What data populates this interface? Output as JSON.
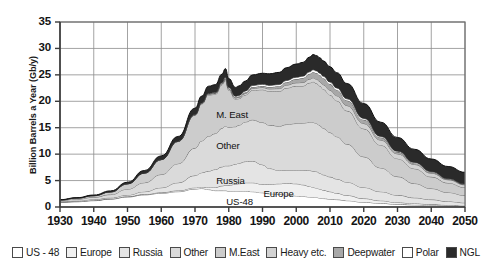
{
  "chart_data": {
    "type": "area",
    "stacked": true,
    "title": "",
    "xlabel": "",
    "ylabel": "Billion Barrels a Year (Gb/y)",
    "xlim": [
      1930,
      2050
    ],
    "ylim": [
      0,
      35
    ],
    "ytick_labels": [
      "0",
      "5",
      "10",
      "15",
      "20",
      "25",
      "30",
      "35"
    ],
    "ytick_values": [
      0,
      5,
      10,
      15,
      20,
      25,
      30,
      35
    ],
    "xtick_labels": [
      "1930",
      "1940",
      "1950",
      "1960",
      "1970",
      "1980",
      "1990",
      "2000",
      "2010",
      "2020",
      "2030",
      "2040",
      "2050"
    ],
    "xtick_values": [
      1930,
      1940,
      1950,
      1960,
      1970,
      1980,
      1990,
      2000,
      2010,
      2020,
      2030,
      2040,
      2050
    ],
    "grid": true,
    "legend_position": "bottom",
    "x": [
      1930,
      1935,
      1940,
      1945,
      1950,
      1955,
      1960,
      1965,
      1970,
      1972,
      1974,
      1976,
      1978,
      1979,
      1980,
      1982,
      1983,
      1985,
      1987,
      1990,
      1992,
      1995,
      1997,
      2000,
      2002,
      2004,
      2005,
      2006,
      2007,
      2008,
      2010,
      2012,
      2015,
      2020,
      2025,
      2030,
      2035,
      2040,
      2045,
      2050
    ],
    "series": [
      {
        "name": "US - 48",
        "color": "#ffffff",
        "values": [
          0.9,
          1.0,
          1.2,
          1.5,
          1.9,
          2.3,
          2.6,
          2.9,
          3.4,
          3.5,
          3.3,
          3.1,
          3.1,
          3.1,
          3.0,
          3.0,
          3.0,
          3.0,
          2.9,
          2.7,
          2.5,
          2.4,
          2.3,
          2.1,
          2.0,
          1.9,
          1.8,
          1.8,
          1.7,
          1.6,
          1.5,
          1.4,
          1.2,
          0.9,
          0.7,
          0.5,
          0.4,
          0.3,
          0.2,
          0.15
        ]
      },
      {
        "name": "Europe",
        "color": "#f0f0f0",
        "values": [
          0.02,
          0.03,
          0.04,
          0.05,
          0.08,
          0.1,
          0.15,
          0.2,
          0.25,
          0.3,
          0.4,
          0.6,
          0.9,
          1.0,
          1.1,
          1.3,
          1.4,
          1.6,
          1.7,
          1.6,
          1.8,
          2.0,
          2.2,
          2.3,
          2.2,
          2.0,
          1.9,
          1.8,
          1.7,
          1.6,
          1.4,
          1.2,
          1.0,
          0.7,
          0.5,
          0.35,
          0.25,
          0.2,
          0.15,
          0.1
        ]
      },
      {
        "name": "Russia",
        "color": "#e4e4e4",
        "values": [
          0.12,
          0.15,
          0.2,
          0.2,
          0.3,
          0.5,
          0.9,
          1.5,
          2.3,
          2.7,
          3.1,
          3.4,
          3.6,
          3.7,
          3.7,
          3.8,
          3.9,
          4.0,
          4.1,
          3.7,
          3.0,
          2.5,
          2.5,
          2.6,
          2.8,
          3.0,
          3.1,
          3.1,
          3.0,
          2.9,
          2.8,
          2.7,
          2.5,
          2.1,
          1.7,
          1.4,
          1.1,
          0.9,
          0.7,
          0.55
        ]
      },
      {
        "name": "Other",
        "color": "#dadada",
        "values": [
          0.2,
          0.3,
          0.4,
          0.6,
          1.1,
          1.7,
          2.5,
          3.6,
          5.2,
          6.0,
          6.6,
          6.8,
          7.3,
          7.5,
          7.3,
          7.1,
          7.2,
          7.5,
          7.8,
          8.0,
          8.2,
          8.4,
          8.6,
          8.8,
          8.9,
          9.1,
          9.2,
          9.1,
          9.0,
          8.8,
          8.4,
          8.0,
          7.2,
          5.8,
          4.5,
          3.5,
          2.7,
          2.1,
          1.7,
          1.4
        ]
      },
      {
        "name": "M.East",
        "color": "#cccccc",
        "values": [
          0.1,
          0.2,
          0.3,
          0.5,
          1.0,
          1.8,
          2.8,
          4.2,
          6.2,
          7.0,
          7.8,
          7.4,
          8.2,
          8.7,
          7.0,
          5.2,
          5.0,
          5.1,
          5.6,
          6.2,
          6.4,
          6.6,
          6.9,
          7.1,
          7.0,
          7.5,
          7.7,
          7.6,
          7.5,
          7.4,
          7.1,
          6.8,
          6.3,
          5.3,
          4.3,
          3.4,
          2.8,
          2.2,
          1.8,
          1.5
        ]
      },
      {
        "name": "Heavy etc.",
        "color": "#d2d2d2",
        "values": [
          0.0,
          0.0,
          0.0,
          0.0,
          0.0,
          0.0,
          0.02,
          0.05,
          0.1,
          0.12,
          0.15,
          0.18,
          0.2,
          0.22,
          0.22,
          0.22,
          0.25,
          0.3,
          0.35,
          0.4,
          0.45,
          0.5,
          0.55,
          0.6,
          0.65,
          0.7,
          0.75,
          0.8,
          0.82,
          0.85,
          0.9,
          0.95,
          1.0,
          1.0,
          0.95,
          0.9,
          0.8,
          0.7,
          0.6,
          0.5
        ]
      },
      {
        "name": "Deepwater",
        "color": "#a8a8a8",
        "values": [
          0.0,
          0.0,
          0.0,
          0.0,
          0.0,
          0.0,
          0.0,
          0.0,
          0.02,
          0.03,
          0.05,
          0.08,
          0.1,
          0.12,
          0.12,
          0.13,
          0.15,
          0.2,
          0.25,
          0.3,
          0.35,
          0.45,
          0.55,
          0.7,
          0.85,
          1.0,
          1.1,
          1.15,
          1.2,
          1.2,
          1.15,
          1.1,
          0.95,
          0.7,
          0.5,
          0.35,
          0.25,
          0.18,
          0.13,
          0.1
        ]
      },
      {
        "name": "Polar",
        "color": "#ffffff",
        "values": [
          0.0,
          0.0,
          0.0,
          0.0,
          0.0,
          0.0,
          0.0,
          0.0,
          0.02,
          0.03,
          0.05,
          0.08,
          0.12,
          0.15,
          0.15,
          0.18,
          0.2,
          0.25,
          0.28,
          0.3,
          0.3,
          0.32,
          0.33,
          0.35,
          0.36,
          0.38,
          0.4,
          0.4,
          0.4,
          0.4,
          0.38,
          0.36,
          0.32,
          0.26,
          0.2,
          0.15,
          0.12,
          0.1,
          0.08,
          0.06
        ]
      },
      {
        "name": "NGL",
        "color": "#2a2a2a",
        "values": [
          0.05,
          0.08,
          0.12,
          0.2,
          0.3,
          0.5,
          0.7,
          0.9,
          1.2,
          1.3,
          1.4,
          1.5,
          1.6,
          1.7,
          1.7,
          1.7,
          1.8,
          1.9,
          2.0,
          2.1,
          2.2,
          2.3,
          2.4,
          2.5,
          2.6,
          2.8,
          2.9,
          2.9,
          2.9,
          2.9,
          2.9,
          2.9,
          2.9,
          2.8,
          2.7,
          2.6,
          2.5,
          2.4,
          2.3,
          2.2
        ]
      }
    ],
    "totals_note": {
      "peak_value": 30.5,
      "peak_year": 2006,
      "value_1979": 23.9,
      "value_1983": 19.5,
      "value_2050": 9.5,
      "value_1930": 1.4
    },
    "area_labels": [
      {
        "text": "M. East",
        "x": 1981,
        "y": 17.4
      },
      {
        "text": "Other",
        "x": 1981,
        "y": 11.6
      },
      {
        "text": "Russia",
        "x": 1981,
        "y": 5.0
      },
      {
        "text": "Europe",
        "x": 1995,
        "y": 2.5
      },
      {
        "text": "US-48",
        "x": 1984,
        "y": 1.0
      }
    ]
  },
  "legend": {
    "items": [
      {
        "label": "US - 48",
        "color": "#ffffff",
        "name": "legend-item-us48"
      },
      {
        "label": "Europe",
        "color": "#f0f0f0",
        "name": "legend-item-europe"
      },
      {
        "label": "Russia",
        "color": "#e4e4e4",
        "name": "legend-item-russia"
      },
      {
        "label": "Other",
        "color": "#dadada",
        "name": "legend-item-other"
      },
      {
        "label": "M.East",
        "color": "#cccccc",
        "name": "legend-item-meast"
      },
      {
        "label": "Heavy etc.",
        "color": "#d2d2d2",
        "name": "legend-item-heavy"
      },
      {
        "label": "Deepwater",
        "color": "#a8a8a8",
        "name": "legend-item-deepwater"
      },
      {
        "label": "Polar",
        "color": "#ffffff",
        "name": "legend-item-polar"
      },
      {
        "label": "NGL",
        "color": "#2a2a2a",
        "name": "legend-item-ngl"
      }
    ]
  }
}
